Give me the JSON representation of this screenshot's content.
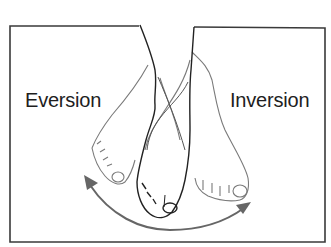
{
  "figure": {
    "labels": {
      "left": "Eversion",
      "right": "Inversion"
    },
    "colors": {
      "frame": "#3a3a3a",
      "outline_dark": "#222222",
      "outline_light": "#777777",
      "arrow": "#666666",
      "text": "#1e1e1e"
    }
  }
}
